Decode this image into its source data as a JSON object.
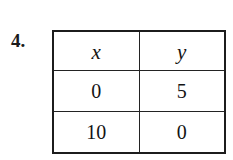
{
  "problem": {
    "number_label": "4."
  },
  "table": {
    "headers": [
      "x",
      "y"
    ],
    "rows": [
      [
        "0",
        "5"
      ],
      [
        "10",
        "0"
      ]
    ]
  },
  "colors": {
    "background": "#ffffff",
    "border": "#1c1c1c",
    "text": "#131313"
  },
  "chart_data": {
    "type": "table",
    "title": "",
    "xlabel": "x",
    "ylabel": "y",
    "columns": [
      "x",
      "y"
    ],
    "x": [
      0,
      10
    ],
    "values": [
      5,
      0
    ],
    "points": [
      {
        "x": 0,
        "y": 5
      },
      {
        "x": 10,
        "y": 0
      }
    ]
  }
}
